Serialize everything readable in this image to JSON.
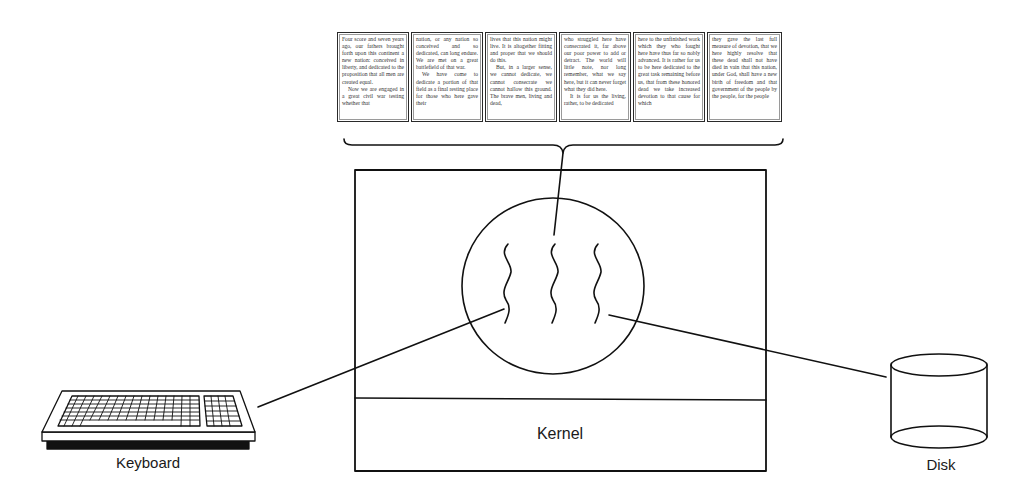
{
  "diagram": {
    "title": ""
  },
  "program_text": {
    "columns": [
      {
        "paragraphs": [
          "Four score and seven years ago, our fathers brought forth upon this continent a new nation: conceived in liberty, and dedicated to the proposition that all men are created equal.",
          "Now we are engaged in a great civil war testing whether that"
        ]
      },
      {
        "paragraphs": [
          "nation, or any nation so conceived and so dedicated, can long endure. We are met on a great battlefield of that war.",
          "We have come to dedicate a portion of that field as a final resting place for those who here gave their"
        ]
      },
      {
        "paragraphs": [
          "lives that this nation might live. It is altogether fitting and proper that we should do this.",
          "But, in a larger sense, we cannot dedicate, we cannot consecrate we cannot hallow this ground. The brave men, living and dead,"
        ]
      },
      {
        "paragraphs": [
          "who struggled here have consecrated it, far above our poor power to add or detract. The world will little note, nor long remember, what we say here, but it can never forget what they did here.",
          "It is for us the living, rather, to be dedicated"
        ]
      },
      {
        "paragraphs": [
          "here to the unfinished work which they who fought here have thus far so nobly advanced. It is rather for us to be here dedicated to the great task remaining before us, that from these honored dead we take increased devotion to that cause for which"
        ]
      },
      {
        "paragraphs": [
          "they gave the last full measure of devotion, that we here highly resolve that these dead shall not have died in vain that this nation, under God, shall have a new birth of freedom and that government of the people by the people, for the people"
        ]
      }
    ]
  },
  "nodes": {
    "kernel": {
      "label": "Kernel"
    },
    "keyboard": {
      "label": "Keyboard"
    },
    "disk": {
      "label": "Disk"
    },
    "process": {
      "label": "",
      "threads": 3
    }
  },
  "edges": [
    {
      "from": "program_text",
      "to": "process"
    },
    {
      "from": "keyboard",
      "to": "process"
    },
    {
      "from": "disk",
      "to": "process"
    }
  ],
  "colors": {
    "stroke": "#111111",
    "background": "#ffffff",
    "panel_text": "#333333"
  }
}
